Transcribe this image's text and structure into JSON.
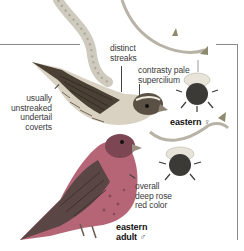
{
  "plate": {
    "subject": "Purple finch field guide illustration",
    "annotations": [
      {
        "id": "distinct-streaks",
        "lines": [
          "distinct",
          "streaks"
        ]
      },
      {
        "id": "contrasty-supercilium",
        "lines": [
          "contrasty pale",
          "supercilium"
        ]
      },
      {
        "id": "undertail-coverts",
        "lines": [
          "usually",
          "unstreaked",
          "undertail",
          "coverts"
        ]
      },
      {
        "id": "deep-rose",
        "lines": [
          "overall",
          "deep rose",
          "red color"
        ]
      }
    ],
    "captions": {
      "female": {
        "text": "eastern",
        "symbol": "♀"
      },
      "male": {
        "line1": "eastern",
        "line2": "adult",
        "symbol": "♂"
      }
    },
    "colors": {
      "rule": "#8a8a8a",
      "male_rose": "#b0485a",
      "male_back": "#6b4a4a",
      "female_streak": "#3d3529",
      "branch": "#c9c4b8"
    }
  }
}
